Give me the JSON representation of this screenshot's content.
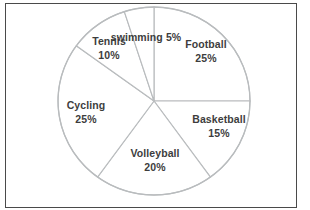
{
  "frame": {
    "border_color": "#4a4a4a",
    "background": "#ffffff"
  },
  "chart_data": {
    "type": "pie",
    "title": "",
    "subtitle": "",
    "xlabel": "",
    "ylabel": "",
    "grid": false,
    "legend_position": "none",
    "label_style": "inside-slice name and percent",
    "start_angle_deg": 0,
    "direction": "clockwise",
    "total_percent": 100,
    "slice_outline_color": "#b9bcbe",
    "slice_fill_color": "#ffffff",
    "categories": [
      "Football",
      "Basketball",
      "Volleyball",
      "Cycling",
      "Tennis",
      "swimming"
    ],
    "values": [
      25,
      15,
      20,
      25,
      10,
      5
    ],
    "labels": [
      "25%",
      "15%",
      "20%",
      "25%",
      "10%",
      "5%"
    ],
    "slices": [
      {
        "name": "Football",
        "value": 25,
        "percent_label": "25%",
        "start_deg": 0,
        "end_deg": 90,
        "label_x": 206,
        "label_y": 52,
        "inline": false
      },
      {
        "name": "Basketball",
        "value": 15,
        "percent_label": "15%",
        "start_deg": 90,
        "end_deg": 144,
        "label_x": 219,
        "label_y": 127,
        "inline": false
      },
      {
        "name": "Volleyball",
        "value": 20,
        "percent_label": "20%",
        "start_deg": 144,
        "end_deg": 216,
        "label_x": 155,
        "label_y": 161,
        "inline": false
      },
      {
        "name": "Cycling",
        "value": 25,
        "percent_label": "25%",
        "start_deg": 216,
        "end_deg": 306,
        "label_x": 86,
        "label_y": 113,
        "inline": false
      },
      {
        "name": "Tennis",
        "value": 10,
        "percent_label": "10%",
        "start_deg": 306,
        "end_deg": 342,
        "label_x": 109,
        "label_y": 49,
        "inline": false
      },
      {
        "name": "swimming",
        "value": 5,
        "percent_label": "5%",
        "start_deg": 342,
        "end_deg": 360,
        "label_x": 146,
        "label_y": 38,
        "inline": true
      }
    ],
    "geometry": {
      "center_x": 154,
      "center_y": 101,
      "radius_x": 96,
      "radius_y": 94
    }
  }
}
